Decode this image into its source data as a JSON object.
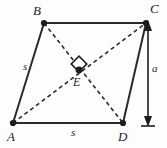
{
  "figure": {
    "background_color": "#fdfdfd",
    "stroke_color": "#2a2a2a",
    "vertices": [
      {
        "id": "A",
        "label": "A",
        "x": 13,
        "y": 123,
        "label_x": 7,
        "label_y": 130
      },
      {
        "id": "B",
        "label": "B",
        "x": 44,
        "y": 23,
        "label_x": 33,
        "label_y": 5
      },
      {
        "id": "C",
        "label": "C",
        "x": 146,
        "y": 23,
        "label_x": 149,
        "label_y": 3
      },
      {
        "id": "D",
        "label": "D",
        "x": 123,
        "y": 123,
        "label_x": 118,
        "label_y": 130
      }
    ],
    "interior_point": {
      "id": "E",
      "label": "E",
      "x": 79,
      "y": 71,
      "label_x": 74,
      "label_y": 76
    },
    "right_angle_marker": {
      "name": "right-angle-marker",
      "center_x": 79,
      "center_y": 64,
      "size": 11
    },
    "solid_sides": [
      {
        "name": "side-AB",
        "from": "A",
        "to": "B"
      },
      {
        "name": "side-BC",
        "from": "B",
        "to": "C"
      },
      {
        "name": "side-CD",
        "from": "C",
        "to": "D"
      },
      {
        "name": "side-DA",
        "from": "D",
        "to": "A"
      }
    ],
    "dashed_diagonals": [
      {
        "name": "diagonal-AC",
        "from": "A",
        "to": "C"
      },
      {
        "name": "diagonal-BD",
        "from": "B",
        "to": "D"
      }
    ],
    "side_labels": [
      {
        "name": "side-length-label-ab",
        "text": "s",
        "x": 24,
        "y": 62
      },
      {
        "name": "side-length-label-ad",
        "text": "s",
        "x": 71,
        "y": 127
      }
    ],
    "height_measure": {
      "name": "height-dimension",
      "label": "a",
      "label_x": 147,
      "label_y": 64,
      "line_x": 148,
      "top_y": 24,
      "bottom_y": 124,
      "baseline_half_width": 7
    }
  }
}
